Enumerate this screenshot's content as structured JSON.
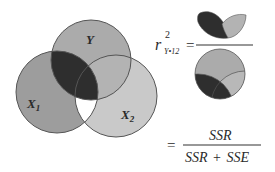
{
  "diagram": {
    "type": "venn-3-circles",
    "circles": [
      {
        "id": "Y",
        "label": "Y",
        "cx": 91,
        "cy": 60,
        "r": 40,
        "fill": "#a9a9a9"
      },
      {
        "id": "X1",
        "label": "X",
        "label_sub": "1",
        "cx": 57,
        "cy": 92,
        "r": 41,
        "fill": "#9c9c9c"
      },
      {
        "id": "X2",
        "label": "X",
        "label_sub": "2",
        "cx": 116,
        "cy": 96,
        "r": 41,
        "fill": "#c8c8c8"
      }
    ],
    "regions": {
      "Y_and_X1": "#2f2f2f",
      "Y_and_X2_only": "#b0b0b0",
      "X1_and_X2_only": "#ffffff",
      "outline": "#555555"
    }
  },
  "formula": {
    "lhs_symbol": "r",
    "lhs_superscript": "2",
    "lhs_subscript": "Y•12",
    "equals": "=",
    "fraction_1": {
      "numerator": "pictorial: Y∩X1 (dark) + Y∩X2 (light) regions",
      "denominator": "pictorial: full Y circle"
    },
    "second_equals": "=",
    "fraction_2": {
      "numerator": "SSR",
      "denominator_left": "SSR",
      "denominator_op": "+",
      "denominator_right": "SSE"
    }
  }
}
